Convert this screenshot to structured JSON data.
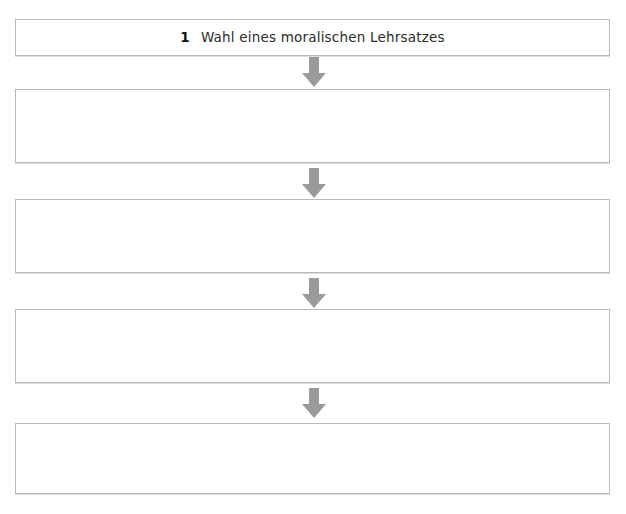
{
  "diagram": {
    "type": "vertical-flowchart",
    "background_color": "#ffffff",
    "box_border_color": "#b9b9b9",
    "box_fill_color": "#ffffff",
    "arrow_color": "#9a9a9a",
    "text_color": "#2b2b2b",
    "steps": [
      {
        "number": "1",
        "label": "Wahl eines moralischen Lehrsatzes",
        "empty": false,
        "top": 19,
        "height": 37
      },
      {
        "number": "",
        "label": "",
        "empty": true,
        "top": 89,
        "height": 74
      },
      {
        "number": "",
        "label": "",
        "empty": true,
        "top": 199,
        "height": 74
      },
      {
        "number": "",
        "label": "",
        "empty": true,
        "top": 309,
        "height": 74
      },
      {
        "number": "",
        "label": "",
        "empty": true,
        "top": 423,
        "height": 71
      }
    ],
    "connectors": [
      {
        "name": "arrow-1",
        "top": 57
      },
      {
        "name": "arrow-2",
        "top": 168
      },
      {
        "name": "arrow-3",
        "top": 278
      },
      {
        "name": "arrow-4",
        "top": 388
      }
    ]
  }
}
